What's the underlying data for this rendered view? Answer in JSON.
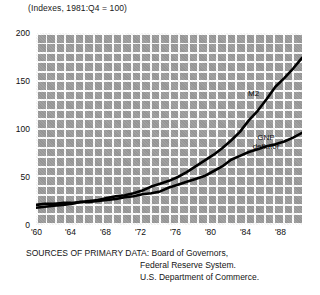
{
  "chart_data": {
    "type": "line",
    "title": "(Indexes, 1981:Q4 = 100)",
    "xlabel": "",
    "ylabel": "",
    "xlim": [
      1959,
      1989
    ],
    "ylim": [
      0,
      200
    ],
    "grid": true,
    "legend_position": "inline-annotation",
    "yticks": [
      "0",
      "50",
      "100",
      "150",
      "200"
    ],
    "ytick_values": [
      0,
      50,
      100,
      150,
      200
    ],
    "xticks": [
      "'60",
      "'64",
      "'68",
      "'72",
      "'76",
      "'80",
      "'84",
      "'88"
    ],
    "xtick_values": [
      1960,
      1964,
      1968,
      1972,
      1976,
      1980,
      1984,
      1988
    ],
    "x": [
      1959,
      1960,
      1961,
      1962,
      1963,
      1964,
      1965,
      1966,
      1967,
      1968,
      1969,
      1970,
      1971,
      1972,
      1973,
      1974,
      1975,
      1976,
      1977,
      1978,
      1979,
      1980,
      1981,
      1982,
      1983,
      1984,
      1985,
      1986,
      1987,
      1988,
      1989
    ],
    "series": [
      {
        "name": "M2",
        "label": "M2",
        "color": "#000000",
        "values": [
          18,
          19,
          20,
          21,
          22,
          24,
          25,
          26,
          28,
          30,
          31,
          33,
          36,
          40,
          43,
          46,
          50,
          55,
          61,
          67,
          73,
          80,
          88,
          97,
          109,
          119,
          131,
          144,
          153,
          163,
          174
        ]
      },
      {
        "name": "GNP deflator",
        "label": "GNP deflator",
        "color": "#000000",
        "values": [
          21,
          22,
          22,
          23,
          23,
          24,
          24,
          25,
          26,
          27,
          29,
          30,
          32,
          33,
          35,
          39,
          42,
          45,
          48,
          51,
          56,
          61,
          68,
          72,
          76,
          79,
          82,
          84,
          87,
          91,
          96
        ]
      }
    ],
    "annotations": [
      {
        "text": "M2",
        "x": 1984.2,
        "y": 150
      },
      {
        "text": "GNP deflator",
        "x": 1984.0,
        "y": 103
      }
    ]
  },
  "source": {
    "line1": "SOURCES OF PRIMARY DATA: Board of Governors,",
    "line2": "Federal Reserve System.",
    "line3": "U.S. Department of Commerce."
  }
}
